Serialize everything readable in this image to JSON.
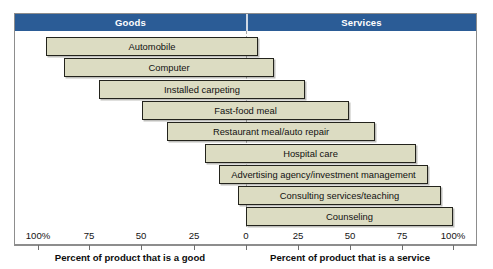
{
  "figure": {
    "headers": {
      "left": "Goods",
      "right": "Services"
    },
    "captions": {
      "left": "Percent of product that is a good",
      "right": "Percent of product that is a service"
    },
    "colors": {
      "header_band": "#2b5c96",
      "header_text": "#ffffff",
      "bar_fill": "#dcdcc2",
      "bar_border": "#23231c",
      "zero_line": "#a7a7a7",
      "frame": "#8d8d8d"
    }
  },
  "chart_data": {
    "type": "bar",
    "title": "",
    "subtitle": "",
    "orientation": "horizontal",
    "style": "diverging-bidirectional",
    "xlabel_left": "Percent of product that is a good",
    "xlabel_right": "Percent of product that is a service",
    "ylabel": "",
    "grid": false,
    "legend": null,
    "axis": {
      "center_value": 0,
      "left_range": [
        100,
        0
      ],
      "right_range": [
        0,
        100
      ],
      "tick_labels": [
        "100%",
        "75",
        "50",
        "25",
        "0",
        "25",
        "50",
        "75",
        "100%"
      ],
      "tick_values": [
        -100,
        -75,
        -50,
        -25,
        0,
        25,
        50,
        75,
        100
      ],
      "tick_px": [
        38,
        89,
        141,
        194,
        246,
        298,
        350,
        402,
        453
      ]
    },
    "categories": [
      "Automobile",
      "Computer",
      "Installed carpeting",
      "Fast-food meal",
      "Restaurant meal/auto repair",
      "Hospital care",
      "Advertising agency/investment management",
      "Consulting services/teaching",
      "Counseling"
    ],
    "series": [
      {
        "name": "Percent of product that is a good",
        "values": [
          96,
          88,
          71,
          50,
          38,
          20,
          13,
          4,
          0
        ]
      },
      {
        "name": "Percent of product that is a service",
        "values": [
          6,
          13,
          28,
          50,
          62,
          82,
          88,
          94,
          100
        ]
      }
    ],
    "bars": [
      {
        "label": "Automobile",
        "good": 96,
        "service": 6,
        "left_px": 46,
        "right_px": 258
      },
      {
        "label": "Computer",
        "good": 88,
        "service": 13,
        "left_px": 64,
        "right_px": 274
      },
      {
        "label": "Installed carpeting",
        "good": 71,
        "service": 28,
        "left_px": 99,
        "right_px": 305
      },
      {
        "label": "Fast-food meal",
        "good": 50,
        "service": 50,
        "left_px": 142,
        "right_px": 349
      },
      {
        "label": "Restaurant meal/auto repair",
        "good": 38,
        "service": 62,
        "left_px": 167,
        "right_px": 375
      },
      {
        "label": "Hospital care",
        "good": 20,
        "service": 82,
        "left_px": 205,
        "right_px": 416
      },
      {
        "label": "Advertising agency/investment management",
        "good": 13,
        "service": 88,
        "left_px": 219,
        "right_px": 428
      },
      {
        "label": "Consulting services/teaching",
        "good": 4,
        "service": 94,
        "left_px": 238,
        "right_px": 441
      },
      {
        "label": "Counseling",
        "good": 0,
        "service": 100,
        "left_px": 246,
        "right_px": 453
      }
    ]
  }
}
